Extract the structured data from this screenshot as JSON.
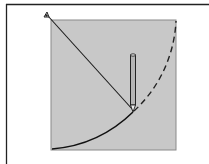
{
  "diagram": {
    "colors": {
      "background": "#ffffff",
      "frame": "#222222",
      "panel_fill": "#c8c8c8",
      "panel_border": "#8a8a8a",
      "string": "#1a1a1a",
      "arc_drawn": "#111111",
      "arc_planned": "#222222",
      "pencil_body": "#b5b5b5",
      "pencil_outline": "#222222"
    },
    "elements": {
      "pin": {
        "x": 47,
        "y": 15
      },
      "pencil_tip": {
        "x": 133,
        "y": 112
      },
      "arc_radius": 131,
      "arc_solid_label": "drawn arc",
      "arc_dashed_label": "remaining arc",
      "string_label": "string",
      "pencil_label": "pencil",
      "panel_label": "board"
    }
  }
}
